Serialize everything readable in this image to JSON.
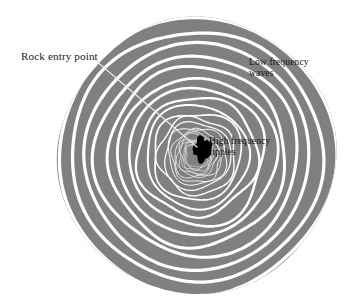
{
  "figure": {
    "background_color": "#ffffff",
    "water_color": "#808080",
    "ripple_color": "#ffffff",
    "rock_color": "#000000",
    "leader_line_color": "#e8e8e8"
  },
  "annotations": {
    "rock_entry": {
      "text": "Rock entry point",
      "color": "#1a1a1a"
    },
    "low_frequency": {
      "text": "Low frequency\nwaves",
      "color": "#16161a"
    },
    "high_frequency": {
      "text": "High frequency\nripples",
      "color": "#141418"
    }
  },
  "chart_data": {
    "type": "diagram",
    "title": "",
    "center": [
      197,
      156
    ],
    "outer_radius": 138,
    "ring_count": 22,
    "ring_radii": [
      138,
      125,
      112.5,
      100.5,
      89,
      78.5,
      68.5,
      59.5,
      51.5,
      44.5,
      38.5,
      33.5,
      29.5,
      26,
      23,
      20.5,
      18.5,
      16.5,
      15,
      13.5,
      12.5,
      11.5
    ],
    "ring_stroke_widths": [
      3.4,
      3.3,
      3.2,
      3.1,
      3.0,
      2.8,
      2.6,
      2.3,
      2.0,
      1.7,
      1.4,
      1.2,
      1.0,
      0.9,
      0.8,
      0.7,
      0.65,
      0.6,
      0.55,
      0.5,
      0.5,
      0.45
    ],
    "rock": {
      "label": "rock",
      "center": [
        202,
        149
      ],
      "width": 18,
      "height": 26
    },
    "leader_line": {
      "from": [
        95,
        60
      ],
      "to": [
        197,
        147
      ]
    },
    "annotation_points": [
      {
        "label": "Rock entry point",
        "target": [
          197,
          147
        ],
        "anchor": [
          21,
          56
        ]
      },
      {
        "label": "Low frequency waves",
        "target": [
          300,
          90
        ],
        "anchor": [
          249,
          62
        ]
      },
      {
        "label": "High frequency ripples",
        "target": [
          215,
          150
        ],
        "anchor": [
          209,
          142
        ]
      }
    ]
  }
}
